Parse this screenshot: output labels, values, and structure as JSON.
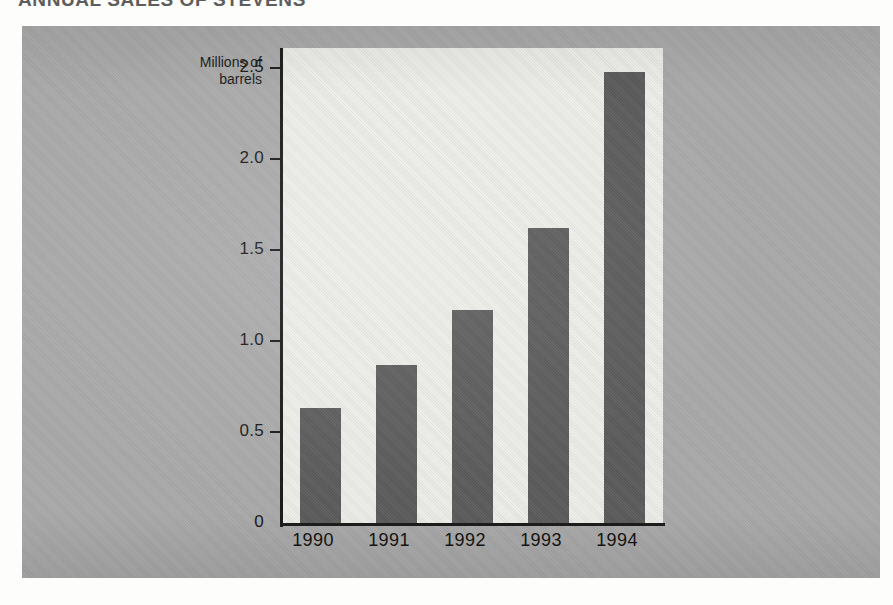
{
  "page": {
    "heading_clipped": "ANNUAL SALES OF STEVENS"
  },
  "chart_data": {
    "type": "bar",
    "title": "ANNUAL SALES OF STEVENS",
    "xlabel": "",
    "ylabel": "Millions of barrels",
    "ylabel_line1": "Millions of",
    "ylabel_line2": "barrels",
    "categories": [
      "1990",
      "1991",
      "1992",
      "1993",
      "1994"
    ],
    "values": [
      0.63,
      0.87,
      1.17,
      1.62,
      2.48
    ],
    "ylim": [
      0,
      2.5
    ],
    "ytick_labels": [
      "0",
      "0.5",
      "1.0",
      "1.5",
      "2.0",
      "2.5"
    ],
    "ytick_values": [
      0,
      0.5,
      1.0,
      1.5,
      2.0,
      2.5
    ],
    "grid": false,
    "legend": false,
    "bar_color": "#5c5c5c",
    "plot_background": "#e7e7e2",
    "panel_background": "#a9a9a9",
    "axis_color": "#1c1c1c"
  }
}
